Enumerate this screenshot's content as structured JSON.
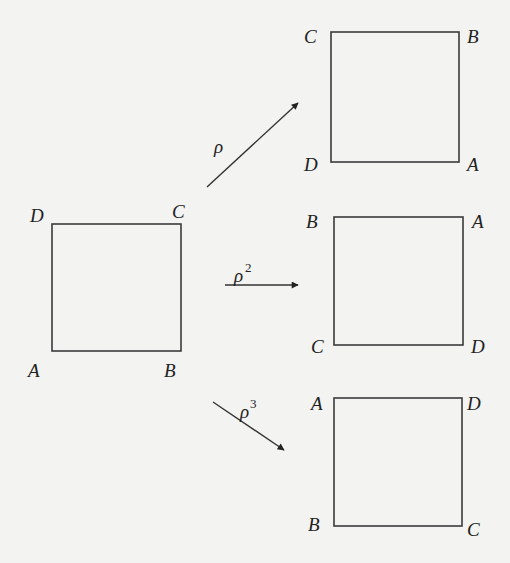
{
  "diagram": {
    "source_square": {
      "corners": {
        "top_left": "D",
        "top_right": "C",
        "bottom_left": "A",
        "bottom_right": "B"
      }
    },
    "transforms": [
      {
        "label": "ρ",
        "exponent": "",
        "result": {
          "top_left": "C",
          "top_right": "B",
          "bottom_left": "D",
          "bottom_right": "A"
        }
      },
      {
        "label": "ρ",
        "exponent": "2",
        "result": {
          "top_left": "B",
          "top_right": "A",
          "bottom_left": "C",
          "bottom_right": "D"
        }
      },
      {
        "label": "ρ",
        "exponent": "3",
        "result": {
          "top_left": "A",
          "top_right": "D",
          "bottom_left": "B",
          "bottom_right": "C"
        }
      }
    ]
  }
}
